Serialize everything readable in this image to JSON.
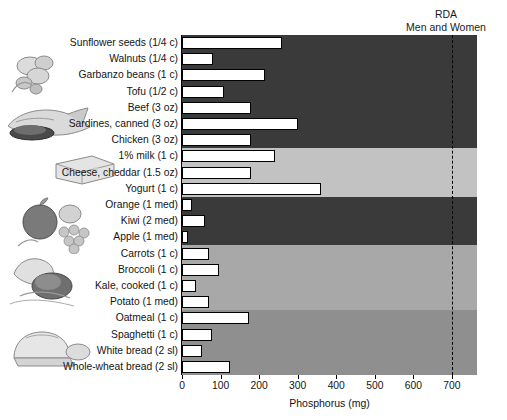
{
  "annotation": {
    "rda_text": "RDA\nMen and Women",
    "rda_value": 700
  },
  "axis": {
    "title": "Phosphorus (mg)",
    "ticks": [
      0,
      100,
      200,
      300,
      400,
      500,
      600,
      700
    ],
    "tick_labels": [
      "0",
      "100",
      "200",
      "300",
      "400",
      "500",
      "600",
      "700"
    ],
    "xlim": [
      0,
      765
    ]
  },
  "groups": [
    {
      "name": "protein-foods",
      "color": "#3a3a3a",
      "count": 7
    },
    {
      "name": "dairy",
      "color": "#c2c2c2",
      "count": 3
    },
    {
      "name": "fruits",
      "color": "#3a3a3a",
      "count": 3
    },
    {
      "name": "vegetables",
      "color": "#a8a8a8",
      "count": 4
    },
    {
      "name": "grains",
      "color": "#8f8f8f",
      "count": 4
    }
  ],
  "chart_data": {
    "type": "bar",
    "title": "",
    "xlabel": "Phosphorus (mg)",
    "ylabel": "",
    "orientation": "horizontal",
    "xlim": [
      0,
      765
    ],
    "grid": false,
    "legend": "none",
    "reference_line": {
      "label": "RDA Men and Women",
      "value": 700,
      "style": "dashed"
    },
    "categories": [
      "Sunflower seeds (1/4 c)",
      "Walnuts (1/4 c)",
      "Garbanzo beans (1 c)",
      "Tofu (1/2 c)",
      "Beef (3 oz)",
      "Sardines, canned (3 oz)",
      "Chicken (3 oz)",
      "1% milk (1 c)",
      "Cheese, cheddar (1.5 oz)",
      "Yogurt (1 c)",
      "Orange (1 med)",
      "Kiwi (2 med)",
      "Apple (1 med)",
      "Carrots (1 c)",
      "Broccoli (1 c)",
      "Kale, cooked (1 c)",
      "Potato (1 med)",
      "Oatmeal (1 c)",
      "Spaghetti (1 c)",
      "White bread (2 sl)",
      "Whole-wheat bread (2 sl)"
    ],
    "values": [
      260,
      80,
      215,
      110,
      180,
      300,
      180,
      240,
      180,
      360,
      25,
      60,
      15,
      70,
      95,
      36,
      70,
      175,
      78,
      52,
      125
    ]
  }
}
